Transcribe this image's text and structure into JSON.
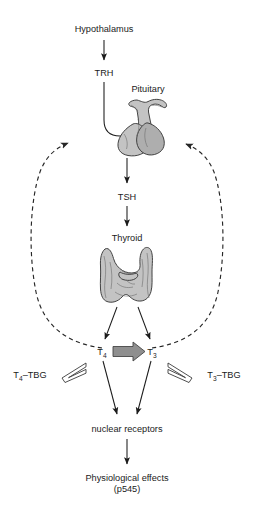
{
  "diagram": {
    "nodes": {
      "hypothalamus": "Hypothalamus",
      "trh": "TRH",
      "pituitary": "Pituitary",
      "tsh": "TSH",
      "thyroid": "Thyroid",
      "t4": "T",
      "t4_sub": "4",
      "t3": "T",
      "t3_sub": "3",
      "t4_tbg_main": "T",
      "t4_tbg_sub": "4",
      "t4_tbg_tail": "–TBG",
      "t3_tbg_main": "T",
      "t3_tbg_sub": "3",
      "t3_tbg_tail": "–TBG",
      "nuclear_receptors": "nuclear receptors",
      "physiological_effects": "Physiological effects",
      "page_ref": "(p545)"
    },
    "colors": {
      "organ_gray": "#c3c3c3",
      "organ_gray_dark": "#aeaeae",
      "outline": "#3a3a3a",
      "text": "#1b1b1b",
      "block_arrow": "#8f8f8f",
      "background": "#ffffff"
    },
    "edges": {
      "hypothalamus_to_trh": "solid arrow down",
      "trh_to_pituitary": "solid curved arrow right",
      "pituitary_to_tsh": "solid arrow down",
      "tsh_to_thyroid": "solid arrow down",
      "thyroid_to_t4": "solid arrow down-left",
      "thyroid_to_t3": "solid arrow down-right",
      "t4_to_t3": "thick gray block arrow right",
      "t4_to_t4tbg": "hollow equilibrium arrow",
      "t3_to_t3tbg": "hollow equilibrium arrow",
      "t4_to_nuclear_receptors": "solid arrow down-right",
      "t3_to_nuclear_receptors": "solid arrow down-left",
      "nuclear_receptors_to_effects": "solid arrow down",
      "feedback_left": "dashed negative feedback arrow to hypothalamus",
      "feedback_right": "dashed negative feedback arrow to pituitary"
    }
  }
}
